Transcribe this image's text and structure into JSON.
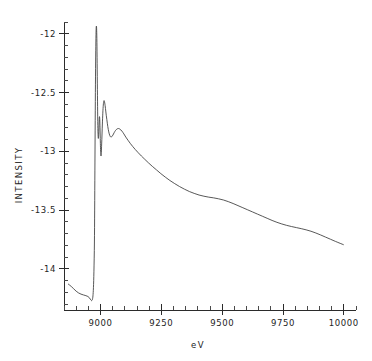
{
  "chart_data": {
    "type": "line",
    "title": "",
    "xlabel": "eV",
    "ylabel": "INTENSITY",
    "xlim": [
      8850,
      10050
    ],
    "ylim": [
      -14.35,
      -11.9
    ],
    "grid": false,
    "legend": null,
    "x_ticks": [
      9000,
      9250,
      9500,
      9750,
      10000
    ],
    "x_tick_labels": [
      "9000",
      "9250",
      "9500",
      "9750",
      "10000"
    ],
    "x_minor_step": 50,
    "y_ticks": [
      -12,
      -12.5,
      -13,
      -13.5,
      -14
    ],
    "y_tick_labels": [
      "-12",
      "-12.5",
      "-13",
      "-13.5",
      "-14"
    ],
    "y_minor_step": 0.1,
    "series": [
      {
        "name": "absorption",
        "points": [
          [
            8868,
            -14.13
          ],
          [
            8880,
            -14.15
          ],
          [
            8890,
            -14.17
          ],
          [
            8900,
            -14.19
          ],
          [
            8910,
            -14.205
          ],
          [
            8920,
            -14.215
          ],
          [
            8930,
            -14.222
          ],
          [
            8940,
            -14.228
          ],
          [
            8948,
            -14.235
          ],
          [
            8954,
            -14.245
          ],
          [
            8958,
            -14.258
          ],
          [
            8961,
            -14.266
          ],
          [
            8963,
            -14.27
          ],
          [
            8965,
            -14.268
          ],
          [
            8967,
            -14.258
          ],
          [
            8969,
            -14.23
          ],
          [
            8971,
            -14.16
          ],
          [
            8973,
            -14.02
          ],
          [
            8975,
            -13.78
          ],
          [
            8976,
            -13.5
          ],
          [
            8977,
            -13.16
          ],
          [
            8978,
            -12.82
          ],
          [
            8979,
            -12.5
          ],
          [
            8980,
            -12.24
          ],
          [
            8981,
            -12.07
          ],
          [
            8982,
            -11.965
          ],
          [
            8983,
            -11.935
          ],
          [
            8984,
            -11.955
          ],
          [
            8985,
            -12.04
          ],
          [
            8986,
            -12.2
          ],
          [
            8987,
            -12.42
          ],
          [
            8988,
            -12.62
          ],
          [
            8989,
            -12.78
          ],
          [
            8990,
            -12.86
          ],
          [
            8991,
            -12.89
          ],
          [
            8992,
            -12.875
          ],
          [
            8993,
            -12.83
          ],
          [
            8994,
            -12.77
          ],
          [
            8995,
            -12.72
          ],
          [
            8996,
            -12.705
          ],
          [
            8997,
            -12.73
          ],
          [
            8998,
            -12.8
          ],
          [
            8999,
            -12.89
          ],
          [
            9000,
            -12.97
          ],
          [
            9001,
            -13.02
          ],
          [
            9002,
            -13.04
          ],
          [
            9003,
            -13.025
          ],
          [
            9004,
            -12.98
          ],
          [
            9006,
            -12.87
          ],
          [
            9008,
            -12.75
          ],
          [
            9010,
            -12.655
          ],
          [
            9012,
            -12.595
          ],
          [
            9014,
            -12.57
          ],
          [
            9016,
            -12.575
          ],
          [
            9019,
            -12.61
          ],
          [
            9022,
            -12.665
          ],
          [
            9026,
            -12.73
          ],
          [
            9030,
            -12.79
          ],
          [
            9034,
            -12.835
          ],
          [
            9038,
            -12.865
          ],
          [
            9042,
            -12.878
          ],
          [
            9046,
            -12.876
          ],
          [
            9051,
            -12.862
          ],
          [
            9056,
            -12.842
          ],
          [
            9062,
            -12.822
          ],
          [
            9068,
            -12.81
          ],
          [
            9074,
            -12.806
          ],
          [
            9080,
            -12.812
          ],
          [
            9088,
            -12.828
          ],
          [
            9096,
            -12.852
          ],
          [
            9104,
            -12.879
          ],
          [
            9113,
            -12.906
          ],
          [
            9122,
            -12.932
          ],
          [
            9132,
            -12.958
          ],
          [
            9143,
            -12.985
          ],
          [
            9155,
            -13.012
          ],
          [
            9168,
            -13.04
          ],
          [
            9182,
            -13.068
          ],
          [
            9197,
            -13.098
          ],
          [
            9213,
            -13.128
          ],
          [
            9230,
            -13.158
          ],
          [
            9248,
            -13.19
          ],
          [
            9266,
            -13.219
          ],
          [
            9285,
            -13.248
          ],
          [
            9305,
            -13.275
          ],
          [
            9325,
            -13.3
          ],
          [
            9345,
            -13.322
          ],
          [
            9365,
            -13.342
          ],
          [
            9385,
            -13.358
          ],
          [
            9405,
            -13.372
          ],
          [
            9425,
            -13.382
          ],
          [
            9445,
            -13.39
          ],
          [
            9465,
            -13.396
          ],
          [
            9485,
            -13.404
          ],
          [
            9505,
            -13.414
          ],
          [
            9525,
            -13.428
          ],
          [
            9545,
            -13.444
          ],
          [
            9565,
            -13.462
          ],
          [
            9585,
            -13.48
          ],
          [
            9605,
            -13.498
          ],
          [
            9625,
            -13.516
          ],
          [
            9645,
            -13.534
          ],
          [
            9665,
            -13.552
          ],
          [
            9685,
            -13.57
          ],
          [
            9705,
            -13.588
          ],
          [
            9725,
            -13.604
          ],
          [
            9745,
            -13.618
          ],
          [
            9765,
            -13.63
          ],
          [
            9785,
            -13.64
          ],
          [
            9805,
            -13.649
          ],
          [
            9825,
            -13.658
          ],
          [
            9845,
            -13.668
          ],
          [
            9865,
            -13.68
          ],
          [
            9885,
            -13.695
          ],
          [
            9905,
            -13.712
          ],
          [
            9925,
            -13.73
          ],
          [
            9945,
            -13.748
          ],
          [
            9965,
            -13.766
          ],
          [
            9985,
            -13.783
          ],
          [
            9998,
            -13.794
          ]
        ]
      }
    ]
  }
}
